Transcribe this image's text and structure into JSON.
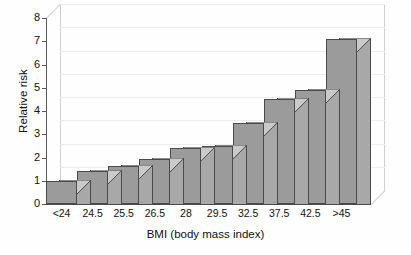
{
  "chart_data": {
    "type": "bar",
    "title": "",
    "subtitle": "",
    "xlabel": "BMI (body mass index)",
    "ylabel": "Relative risk",
    "categories": [
      "<24",
      "24.5",
      "25.5",
      "26.5",
      "28",
      "29.5",
      "32.5",
      "37.5",
      "42.5",
      ">45"
    ],
    "values": [
      1.0,
      1.4,
      1.65,
      1.95,
      2.4,
      2.5,
      3.5,
      4.5,
      4.9,
      7.1
    ],
    "series": [
      {
        "name": "Relative risk",
        "values": [
          1.0,
          1.4,
          1.65,
          1.95,
          2.4,
          2.5,
          3.5,
          4.5,
          4.9,
          7.1
        ]
      }
    ],
    "ylim": [
      0,
      8
    ],
    "xlim": null,
    "yticks": [
      0,
      1,
      2,
      3,
      4,
      5,
      6,
      7,
      8
    ],
    "ytick_labels": [
      "0",
      "1",
      "2",
      "3",
      "4",
      "5",
      "6",
      "7",
      "8"
    ],
    "grid": true,
    "grid_axis": "y",
    "legend": false,
    "legend_position": "none",
    "style": "3d-column",
    "colors": {
      "bar_front": "#9b9b9b",
      "bar_top": "#cacaca",
      "bar_side": "#a8a8a8",
      "bar_edge": "#4a4a4a",
      "grid_line": "#ededed",
      "axis_line": "#5a5a5a",
      "wall_line": "#cfcfcf",
      "background": "#fefefe",
      "text": "#111111"
    },
    "annotations": []
  }
}
